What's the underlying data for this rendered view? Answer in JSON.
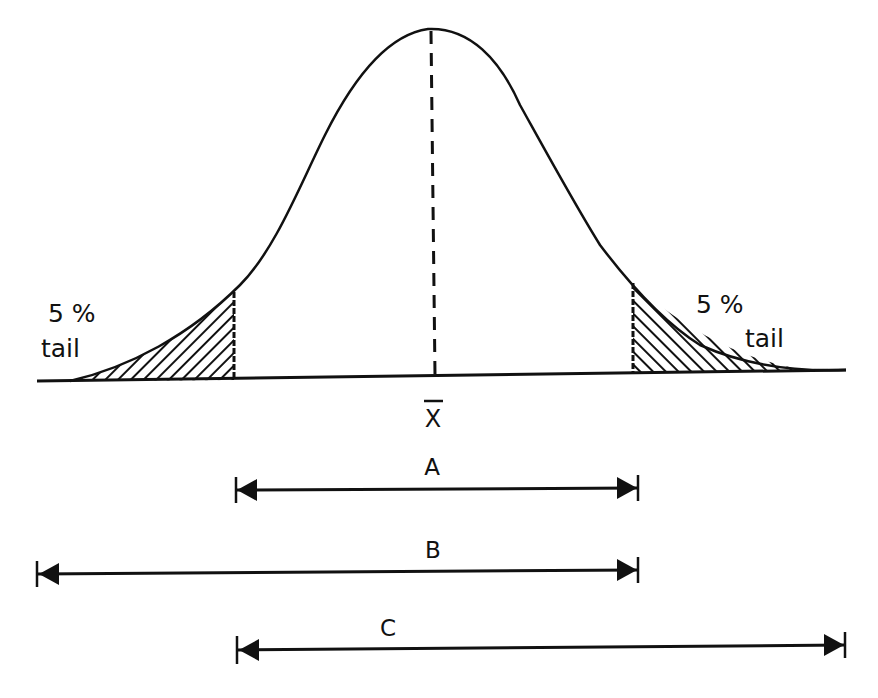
{
  "figure": {
    "colors": {
      "ink": "#111111",
      "background": "#ffffff"
    },
    "curve": {
      "peak": {
        "x": 432,
        "y": 29
      },
      "baseline_left": {
        "x": 37,
        "y": 381
      },
      "baseline_right": {
        "x": 846,
        "y": 370
      }
    },
    "mean_line": {
      "label": "X",
      "overbar": true,
      "x": 435
    },
    "tails": [
      {
        "side": "left",
        "percent_label": "5 %",
        "word_label": "tail",
        "cutoff_x": 234
      },
      {
        "side": "right",
        "percent_label": "5 %",
        "word_label": "tail",
        "cutoff_x": 633
      }
    ],
    "ranges": [
      {
        "label": "A",
        "x1": 235,
        "x2": 638,
        "y": 490,
        "label_x": 432,
        "label_y": 476
      },
      {
        "label": "B",
        "x1": 37,
        "x2": 638,
        "y": 572,
        "label_x": 432,
        "label_y": 558
      },
      {
        "label": "C",
        "x1": 237,
        "x2": 845,
        "y": 648,
        "label_x": 432,
        "label_y": 636
      }
    ]
  }
}
